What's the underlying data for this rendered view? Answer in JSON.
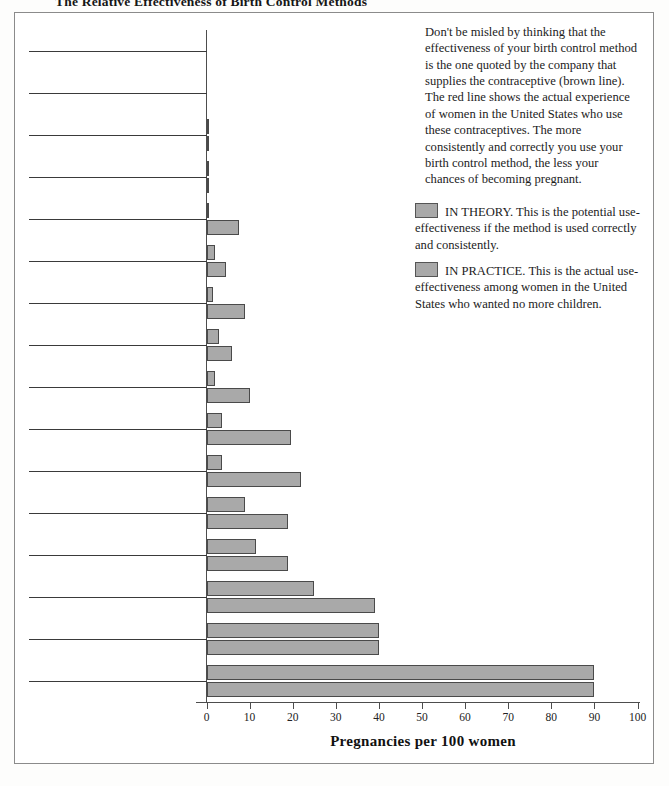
{
  "title": "The Relative Effectiveness of Birth Control Methods",
  "note": "Don't be misled by thinking that the effectiveness of your birth control method is the one quoted by the company that supplies the contraceptive (brown line). The red line shows the actual experience of women in the United States who use these contraceptives. The more consistently and correctly you use your birth control method, the less your chances of becoming pregnant.",
  "legend": {
    "theory": "IN THEORY. This is the potential use-effectiveness if the method is used correctly and consistently.",
    "practice": "IN PRACTICE. This is the actual use-effectiveness among women in the United States who wanted no more children.",
    "swatch_color": "#a9a9a9"
  },
  "chart_data": {
    "type": "bar",
    "orientation": "horizontal",
    "title": "The Relative Effectiveness of Birth Control Methods",
    "xlabel": "Pregnancies per 100 women",
    "ylabel": "",
    "xlim": [
      0,
      100
    ],
    "xticks": [
      0,
      10,
      20,
      30,
      40,
      50,
      60,
      70,
      80,
      90,
      100
    ],
    "grid": false,
    "legend_position": "right",
    "categories": [
      "Abortion",
      "Abstinence",
      "Tubal ligation",
      "Vasectomy",
      "Combination pill",
      "Condom with spermicide",
      "Mini-pill",
      "IUD",
      "Condom",
      "Diaphragm with spermicide",
      "Foam",
      "Coitus interruptus",
      "Rhythm method",
      "Lactation for 12 months",
      "Douche",
      "No method"
    ],
    "series": [
      {
        "name": "IN THEORY",
        "color": "#a9a9a9",
        "values": [
          0,
          0,
          0.4,
          0.4,
          0.5,
          2,
          1.5,
          3,
          2,
          3.5,
          3.5,
          9,
          11.5,
          25,
          40,
          90
        ]
      },
      {
        "name": "IN PRACTICE",
        "color": "#a9a9a9",
        "values": [
          0,
          0,
          0.4,
          0.4,
          7.5,
          4.5,
          9,
          6,
          10,
          19.5,
          22,
          19,
          19,
          39,
          40,
          90
        ]
      }
    ]
  }
}
